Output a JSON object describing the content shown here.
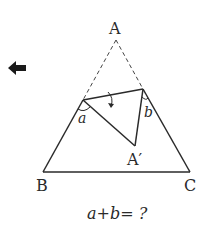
{
  "figure": {
    "type": "triangle-fold",
    "vertices": {
      "A": {
        "label": "A",
        "x": 116,
        "y": 39
      },
      "B": {
        "label": "B",
        "x": 43,
        "y": 172
      },
      "C": {
        "label": "C",
        "x": 190,
        "y": 172
      },
      "A_prime": {
        "label": "A′",
        "x": 135,
        "y": 146
      }
    },
    "fold_points": {
      "left": {
        "x": 83,
        "y": 100
      },
      "right": {
        "x": 143,
        "y": 89
      }
    },
    "angles": {
      "a": {
        "label": "a"
      },
      "b": {
        "label": "b"
      }
    },
    "line_color": "#2a2a2a"
  },
  "question": "a+b= ?",
  "back_arrow": {
    "icon": "left-arrow-icon",
    "color": "#1a1a1a"
  }
}
